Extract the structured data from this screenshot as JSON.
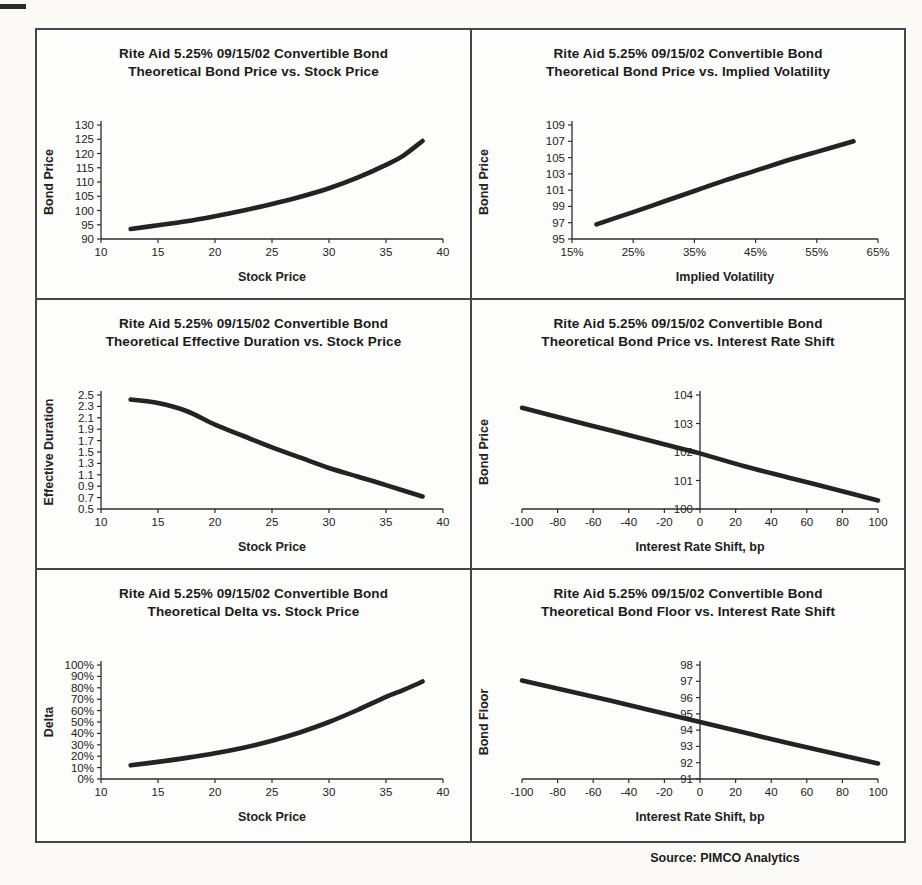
{
  "page": {
    "source_note": "Source: PIMCO Analytics"
  },
  "chart_data": [
    {
      "type": "line",
      "title_line1": "Rite Aid 5.25% 09/15/02 Convertible Bond",
      "title_line2": "Theoretical Bond Price vs. Stock Price",
      "xlabel": "Stock Price",
      "ylabel": "Bond Price",
      "x": [
        12.6,
        15,
        17.5,
        20,
        22.5,
        25,
        27.5,
        30,
        32.5,
        35,
        36.5,
        38.2
      ],
      "y": [
        93.5,
        94.8,
        96.2,
        98.0,
        100.0,
        102.3,
        104.8,
        107.8,
        111.5,
        116.0,
        119.2,
        124.4
      ],
      "xlim": [
        10,
        40
      ],
      "ylim": [
        90,
        130
      ],
      "xticks": [
        10,
        15,
        20,
        25,
        30,
        35,
        40
      ],
      "xtick_labels": [
        "10",
        "15",
        "20",
        "25",
        "30",
        "35",
        "40"
      ],
      "yticks": [
        90,
        95,
        100,
        105,
        110,
        115,
        120,
        125,
        130
      ],
      "ytick_labels": [
        "90",
        "95",
        "100",
        "105",
        "110",
        "115",
        "120",
        "125",
        "130"
      ],
      "y_axis_at": null,
      "grid": "off",
      "legend": "none",
      "line_color": "#232323"
    },
    {
      "type": "line",
      "title_line1": "Rite Aid 5.25% 09/15/02 Convertible Bond",
      "title_line2": "Theoretical Bond Price vs. Implied Volatility",
      "xlabel": "Implied Volatility",
      "ylabel": "Bond Price",
      "x": [
        19,
        25,
        30,
        35,
        40,
        45,
        50,
        55,
        61
      ],
      "y": [
        96.8,
        98.3,
        99.6,
        100.9,
        102.2,
        103.4,
        104.6,
        105.7,
        107.0
      ],
      "xlim": [
        15,
        65
      ],
      "ylim": [
        95,
        109
      ],
      "xticks": [
        15,
        25,
        35,
        45,
        55,
        65
      ],
      "xtick_labels": [
        "15%",
        "25%",
        "35%",
        "45%",
        "55%",
        "65%"
      ],
      "yticks": [
        95,
        97,
        99,
        101,
        103,
        105,
        107,
        109
      ],
      "ytick_labels": [
        "95",
        "97",
        "99",
        "101",
        "103",
        "105",
        "107",
        "109"
      ],
      "y_axis_at": null,
      "grid": "off",
      "legend": "none",
      "line_color": "#232323"
    },
    {
      "type": "line",
      "title_line1": "Rite Aid 5.25% 09/15/02 Convertible Bond",
      "title_line2": "Theoretical Effective Duration vs. Stock Price",
      "xlabel": "Stock Price",
      "ylabel": "Effective Duration",
      "x": [
        12.6,
        15,
        17.5,
        20,
        22.5,
        25,
        27.5,
        30,
        32.5,
        35,
        38.2
      ],
      "y": [
        2.42,
        2.36,
        2.22,
        1.98,
        1.78,
        1.58,
        1.4,
        1.22,
        1.07,
        0.92,
        0.72
      ],
      "xlim": [
        10,
        40
      ],
      "ylim": [
        0.5,
        2.5
      ],
      "xticks": [
        10,
        15,
        20,
        25,
        30,
        35,
        40
      ],
      "xtick_labels": [
        "10",
        "15",
        "20",
        "25",
        "30",
        "35",
        "40"
      ],
      "yticks": [
        0.5,
        0.7,
        0.9,
        1.1,
        1.3,
        1.5,
        1.7,
        1.9,
        2.1,
        2.3,
        2.5
      ],
      "ytick_labels": [
        "0.5",
        "0.7",
        "0.9",
        "1.1",
        "1.3",
        "1.5",
        "1.7",
        "1.9",
        "2.1",
        "2.3",
        "2.5"
      ],
      "y_axis_at": null,
      "grid": "off",
      "legend": "none",
      "line_color": "#232323"
    },
    {
      "type": "line",
      "title_line1": "Rite Aid 5.25% 09/15/02 Convertible Bond",
      "title_line2": "Theoretical Bond Price vs. Interest Rate Shift",
      "xlabel": "Interest Rate Shift, bp",
      "ylabel": "Bond Price",
      "x": [
        -100,
        -75,
        -50,
        -25,
        0,
        25,
        50,
        75,
        100
      ],
      "y": [
        103.55,
        103.15,
        102.75,
        102.35,
        101.95,
        101.5,
        101.1,
        100.7,
        100.3
      ],
      "xlim": [
        -100,
        100
      ],
      "ylim": [
        100,
        104
      ],
      "xticks": [
        -100,
        -80,
        -60,
        -40,
        -20,
        0,
        20,
        40,
        60,
        80,
        100
      ],
      "xtick_labels": [
        "-100",
        "-80",
        "-60",
        "-40",
        "-20",
        "0",
        "20",
        "40",
        "60",
        "80",
        "100"
      ],
      "yticks": [
        100,
        101,
        102,
        103,
        104
      ],
      "ytick_labels": [
        "100",
        "101",
        "102",
        "103",
        "104"
      ],
      "y_axis_at": 0,
      "grid": "off",
      "legend": "none",
      "line_color": "#232323"
    },
    {
      "type": "line",
      "title_line1": "Rite Aid 5.25% 09/15/02 Convertible Bond",
      "title_line2": "Theoretical Delta vs. Stock Price",
      "xlabel": "Stock Price",
      "ylabel": "Delta",
      "x": [
        12.6,
        15,
        17.5,
        20,
        22.5,
        25,
        27.5,
        30,
        32.5,
        35,
        36.5,
        38.2
      ],
      "y": [
        12,
        15,
        18.5,
        22.5,
        27.5,
        33.5,
        41,
        50,
        60.5,
        72,
        78,
        85.5
      ],
      "xlim": [
        10,
        40
      ],
      "ylim": [
        0,
        100
      ],
      "xticks": [
        10,
        15,
        20,
        25,
        30,
        35,
        40
      ],
      "xtick_labels": [
        "10",
        "15",
        "20",
        "25",
        "30",
        "35",
        "40"
      ],
      "yticks": [
        0,
        10,
        20,
        30,
        40,
        50,
        60,
        70,
        80,
        90,
        100
      ],
      "ytick_labels": [
        "0%",
        "10%",
        "20%",
        "30%",
        "40%",
        "50%",
        "60%",
        "70%",
        "80%",
        "90%",
        "100%"
      ],
      "y_axis_at": null,
      "grid": "off",
      "legend": "none",
      "line_color": "#232323"
    },
    {
      "type": "line",
      "title_line1": "Rite Aid 5.25% 09/15/02 Convertible Bond",
      "title_line2": "Theoretical Bond Floor vs. Interest Rate Shift",
      "xlabel": "Interest Rate Shift, bp",
      "ylabel": "Bond Floor",
      "x": [
        -100,
        -50,
        0,
        50,
        100
      ],
      "y": [
        97.05,
        95.8,
        94.5,
        93.2,
        91.95
      ],
      "xlim": [
        -100,
        100
      ],
      "ylim": [
        91,
        98
      ],
      "xticks": [
        -100,
        -80,
        -60,
        -40,
        -20,
        0,
        20,
        40,
        60,
        80,
        100
      ],
      "xtick_labels": [
        "-100",
        "-80",
        "-60",
        "-40",
        "-20",
        "0",
        "20",
        "40",
        "60",
        "80",
        "100"
      ],
      "yticks": [
        91,
        92,
        93,
        94,
        95,
        96,
        97,
        98
      ],
      "ytick_labels": [
        "91",
        "92",
        "93",
        "94",
        "95",
        "96",
        "97",
        "98"
      ],
      "y_axis_at": 0,
      "grid": "off",
      "legend": "none",
      "line_color": "#232323"
    }
  ]
}
